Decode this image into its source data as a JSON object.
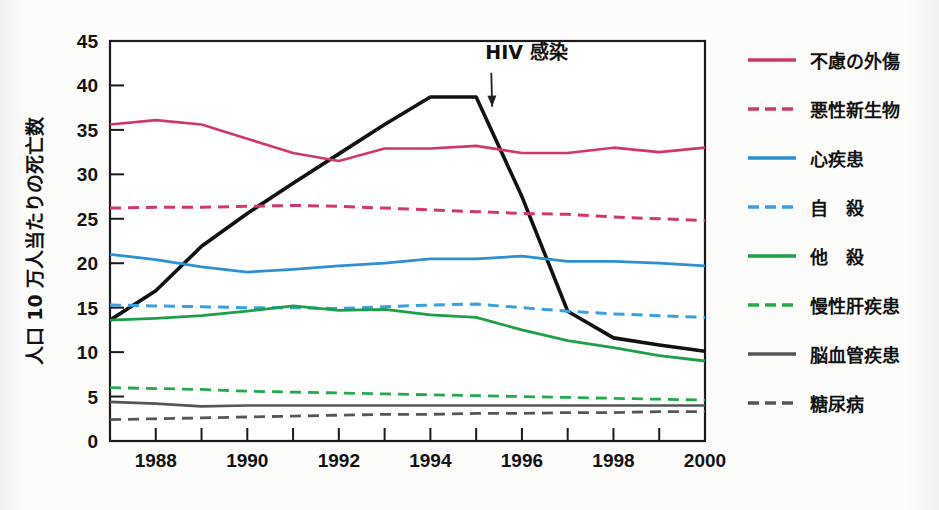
{
  "chart_data": {
    "type": "line",
    "title": "",
    "xlabel": "",
    "ylabel": "人口 10 万人当たりの死亡数",
    "xlim": [
      1987,
      2000
    ],
    "ylim": [
      0,
      45
    ],
    "grid": false,
    "legend_position": "right",
    "x": [
      1987,
      1988,
      1989,
      1990,
      1991,
      1992,
      1993,
      1994,
      1995,
      1996,
      1997,
      1998,
      1999,
      2000
    ],
    "x_tick_labels": [
      "1988",
      "1990",
      "1992",
      "1994",
      "1996",
      "1998",
      "2000"
    ],
    "x_tick_values": [
      1988,
      1990,
      1992,
      1994,
      1996,
      1998,
      2000
    ],
    "y_tick_labels": [
      "0",
      "5",
      "10",
      "15",
      "20",
      "25",
      "30",
      "35",
      "40",
      "45"
    ],
    "y_tick_values": [
      0,
      5,
      10,
      15,
      20,
      25,
      30,
      35,
      40,
      45
    ],
    "annotations": [
      {
        "text": "HIV 感染",
        "x": 1995.2,
        "y": 43.0,
        "arrow_to_x": 1995.35,
        "arrow_to_y": 37.6
      }
    ],
    "series": [
      {
        "name": "HIV 感染",
        "color": "#111111",
        "style": "solid",
        "width": 3.6,
        "in_legend": false,
        "values": [
          13.6,
          16.9,
          21.9,
          25.6,
          29.0,
          32.3,
          35.6,
          38.7,
          38.7,
          27.5,
          14.6,
          11.6,
          10.8,
          10.1
        ]
      },
      {
        "name": "不慮の外傷",
        "color": "#d1386a",
        "style": "solid",
        "width": 2.6,
        "in_legend": true,
        "values": [
          35.6,
          36.1,
          35.6,
          34.0,
          32.4,
          31.5,
          32.9,
          32.9,
          33.2,
          32.4,
          32.4,
          33.0,
          32.5,
          33.0
        ]
      },
      {
        "name": "悪性新生物",
        "color": "#d1386a",
        "style": "dashed",
        "width": 3.0,
        "in_legend": true,
        "values": [
          26.2,
          26.3,
          26.3,
          26.4,
          26.5,
          26.4,
          26.2,
          26.0,
          25.8,
          25.6,
          25.5,
          25.2,
          25.0,
          24.8
        ]
      },
      {
        "name": "心疾患",
        "color": "#2e8fd2",
        "style": "solid",
        "width": 2.8,
        "in_legend": true,
        "values": [
          21.0,
          20.4,
          19.6,
          19.0,
          19.3,
          19.7,
          20.0,
          20.5,
          20.5,
          20.8,
          20.2,
          20.2,
          20.0,
          19.7
        ]
      },
      {
        "name": "自　殺",
        "color": "#3aa0e0",
        "style": "dashed",
        "width": 3.0,
        "in_legend": true,
        "values": [
          15.3,
          15.2,
          15.1,
          15.0,
          15.0,
          14.9,
          15.1,
          15.3,
          15.4,
          15.0,
          14.6,
          14.3,
          14.1,
          13.9
        ]
      },
      {
        "name": "他　殺",
        "color": "#1f9e4a",
        "style": "solid",
        "width": 2.8,
        "in_legend": true,
        "values": [
          13.6,
          13.8,
          14.1,
          14.6,
          15.2,
          14.7,
          14.8,
          14.2,
          13.9,
          12.5,
          11.3,
          10.5,
          9.6,
          9.0
        ]
      },
      {
        "name": "慢性肝疾患",
        "color": "#26a84f",
        "style": "dashed",
        "width": 2.8,
        "in_legend": true,
        "values": [
          6.0,
          5.9,
          5.8,
          5.6,
          5.5,
          5.4,
          5.3,
          5.2,
          5.1,
          5.0,
          4.9,
          4.8,
          4.7,
          4.6
        ]
      },
      {
        "name": "脳血管疾患",
        "color": "#54575a",
        "style": "solid",
        "width": 2.6,
        "in_legend": true,
        "values": [
          4.4,
          4.2,
          3.9,
          4.0,
          4.0,
          4.0,
          4.0,
          4.0,
          4.0,
          4.0,
          4.0,
          4.0,
          4.0,
          4.0
        ]
      },
      {
        "name": "糖尿病",
        "color": "#54575a",
        "style": "dashed",
        "width": 2.8,
        "in_legend": true,
        "values": [
          2.4,
          2.5,
          2.6,
          2.7,
          2.8,
          2.9,
          3.0,
          3.0,
          3.1,
          3.1,
          3.2,
          3.2,
          3.3,
          3.3
        ]
      }
    ]
  },
  "legend": {
    "items": [
      {
        "label": "不慮の外傷",
        "color": "#d1386a",
        "style": "solid"
      },
      {
        "label": "悪性新生物",
        "color": "#d1386a",
        "style": "dashed"
      },
      {
        "label": "心疾患",
        "color": "#2e8fd2",
        "style": "solid"
      },
      {
        "label": "自　殺",
        "color": "#3aa0e0",
        "style": "dashed"
      },
      {
        "label": "他　殺",
        "color": "#1f9e4a",
        "style": "solid"
      },
      {
        "label": "慢性肝疾患",
        "color": "#26a84f",
        "style": "dashed"
      },
      {
        "label": "脳血管疾患",
        "color": "#54575a",
        "style": "solid"
      },
      {
        "label": "糖尿病",
        "color": "#54575a",
        "style": "dashed"
      }
    ]
  },
  "colors": {
    "axis": "#1a1a1a",
    "text": "#111111",
    "background": "#fbfbfa"
  }
}
